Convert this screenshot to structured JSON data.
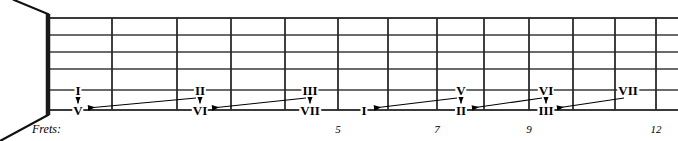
{
  "figure": {
    "kind": "guitar-fretboard-diagram",
    "width": 678,
    "height": 141,
    "background_color": "#ffffff",
    "ink_color": "#000000"
  },
  "fretboard": {
    "nut_x": 48,
    "nut_color": "#1a1a1a",
    "board_right_x": 678,
    "string_count": 6,
    "string_ys": [
      18,
      35,
      52,
      69,
      90,
      110
    ],
    "string_color": "#3a3a3a",
    "fret_xs": [
      112,
      177,
      231,
      285,
      338,
      388,
      437,
      484,
      529,
      573,
      615,
      656
    ],
    "fret_color": "#2b2b2b",
    "perspective": {
      "top_line": {
        "x1": 48,
        "y1": 14,
        "x2": 14,
        "y2": 0
      },
      "bottom_line": {
        "x1": 48,
        "y1": 115,
        "x2": 0,
        "y2": 141
      }
    }
  },
  "axis": {
    "caption": "Frets:",
    "caption_x": 32,
    "caption_y": 129,
    "numbers": [
      {
        "label": "5",
        "x": 338,
        "y": 129
      },
      {
        "label": "7",
        "x": 437,
        "y": 129
      },
      {
        "label": "9",
        "x": 529,
        "y": 129
      },
      {
        "label": "12",
        "x": 656,
        "y": 129
      }
    ]
  },
  "markers": [
    {
      "id": "m1-top",
      "label": "I",
      "x": 78,
      "y": 90,
      "string": 5
    },
    {
      "id": "m1-bottom",
      "label": "V",
      "x": 78,
      "y": 110,
      "string": 6
    },
    {
      "id": "m2-top",
      "label": "II",
      "x": 200,
      "y": 90,
      "string": 5
    },
    {
      "id": "m2-bottom",
      "label": "VI",
      "x": 200,
      "y": 110,
      "string": 6
    },
    {
      "id": "m3-top",
      "label": "III",
      "x": 310,
      "y": 90,
      "string": 5
    },
    {
      "id": "m3-bottom",
      "label": "VII",
      "x": 310,
      "y": 110,
      "string": 6
    },
    {
      "id": "m4-bottom",
      "label": "I",
      "x": 364,
      "y": 110,
      "string": 6
    },
    {
      "id": "m5-top",
      "label": "V",
      "x": 461,
      "y": 90,
      "string": 5
    },
    {
      "id": "m5-bottom",
      "label": "II",
      "x": 461,
      "y": 110,
      "string": 6
    },
    {
      "id": "m6-top",
      "label": "VI",
      "x": 546,
      "y": 90,
      "string": 5
    },
    {
      "id": "m6-bottom",
      "label": "III",
      "x": 546,
      "y": 110,
      "string": 6
    },
    {
      "id": "m7-top",
      "label": "VII",
      "x": 628,
      "y": 90,
      "string": 5
    }
  ],
  "up_arrows": [
    {
      "id": "up-1",
      "x": 78,
      "y_from": 104,
      "y_to": 97
    },
    {
      "id": "up-2",
      "x": 200,
      "y_from": 104,
      "y_to": 97
    },
    {
      "id": "up-3",
      "x": 310,
      "y_from": 104,
      "y_to": 97
    },
    {
      "id": "up-4",
      "x": 461,
      "y_from": 104,
      "y_to": 97
    },
    {
      "id": "up-5",
      "x": 546,
      "y_from": 104,
      "y_to": 97
    }
  ],
  "slide_arrows": [
    {
      "id": "slide-1",
      "x_from": 196,
      "y_from": 98,
      "x_to": 88,
      "y_to": 108
    },
    {
      "id": "slide-2",
      "x_from": 306,
      "y_from": 98,
      "x_to": 212,
      "y_to": 108
    },
    {
      "id": "slide-3",
      "x_from": 457,
      "y_from": 98,
      "x_to": 374,
      "y_to": 108
    },
    {
      "id": "slide-4",
      "x_from": 542,
      "y_from": 98,
      "x_to": 472,
      "y_to": 108
    },
    {
      "id": "slide-5",
      "x_from": 624,
      "y_from": 98,
      "x_to": 557,
      "y_to": 108
    }
  ]
}
